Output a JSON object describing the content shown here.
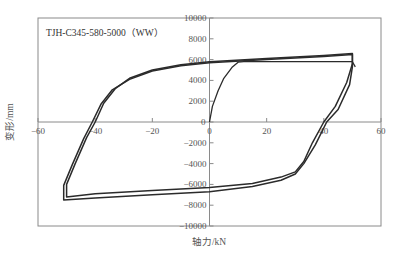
{
  "chart_data": {
    "type": "line",
    "title": "TJH-C345-580-5000（WW）",
    "xlabel": "轴力/kN",
    "ylabel": "变形/mm",
    "xlim": [
      -60,
      60
    ],
    "ylim": [
      -10000,
      10000
    ],
    "x_ticks": [
      -60,
      -40,
      -20,
      0,
      20,
      40,
      60
    ],
    "y_ticks": [
      10000,
      8000,
      6000,
      4000,
      2000,
      0,
      -2000,
      -4000,
      -6000,
      -8000,
      -10000
    ],
    "x_tick_labels": [
      "−60",
      "−40",
      "−20",
      "0",
      "20",
      "40",
      "60"
    ],
    "y_tick_labels": [
      "10000",
      "8000",
      "6000",
      "4000",
      "2000",
      "0",
      "−2000",
      "−4000",
      "−6000",
      "−8000",
      "−10000"
    ],
    "grid": false,
    "legend": null,
    "series": [
      {
        "name": "initial loading",
        "x": [
          0,
          1,
          3,
          5,
          8,
          10,
          12,
          50,
          51
        ],
        "y": [
          0,
          1500,
          3000,
          4200,
          5300,
          5750,
          5800,
          5800,
          5300
        ]
      },
      {
        "name": "hysteresis loop 1",
        "x": [
          -40,
          -37,
          -33,
          -28,
          -20,
          -10,
          0,
          20,
          40,
          50,
          50,
          48,
          44,
          40,
          36,
          33,
          30,
          25,
          15,
          0,
          -20,
          -40,
          -50,
          -50,
          -47,
          -43,
          -40
        ],
        "y": [
          0,
          1800,
          3200,
          4200,
          5000,
          5500,
          5800,
          6100,
          6400,
          6600,
          5600,
          3800,
          1500,
          0,
          -2000,
          -3800,
          -4800,
          -5300,
          -5900,
          -6300,
          -6600,
          -6900,
          -7200,
          -6000,
          -4000,
          -1500,
          0
        ]
      },
      {
        "name": "hysteresis loop 2",
        "x": [
          -41,
          -38,
          -34,
          -28,
          -20,
          -10,
          0,
          20,
          40,
          50,
          50,
          49,
          45,
          41,
          37,
          33,
          30,
          25,
          15,
          0,
          -20,
          -40,
          -51,
          -51,
          -48,
          -44,
          -41
        ],
        "y": [
          0,
          1700,
          3100,
          4100,
          4900,
          5400,
          5700,
          6000,
          6300,
          6500,
          5300,
          3600,
          1200,
          0,
          -2200,
          -4000,
          -5000,
          -5600,
          -6200,
          -6700,
          -7000,
          -7300,
          -7500,
          -6100,
          -4100,
          -1600,
          0
        ]
      }
    ]
  }
}
